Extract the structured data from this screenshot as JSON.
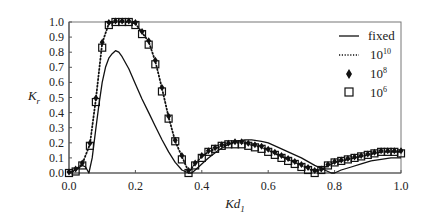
{
  "chart_data": {
    "type": "line",
    "title": "",
    "xlabel": "Kd",
    "xlabel_subscript": "1",
    "ylabel": "K",
    "ylabel_subscript": "r",
    "xlim": [
      0.0,
      1.0
    ],
    "ylim": [
      0.0,
      1.0
    ],
    "xticks": [
      "0.0",
      "0.2",
      "0.4",
      "0.6",
      "0.8",
      "1.0"
    ],
    "yticks": [
      "0.0",
      "0.1",
      "0.2",
      "0.3",
      "0.4",
      "0.5",
      "0.6",
      "0.7",
      "0.8",
      "0.9",
      "1.0"
    ],
    "grid": false,
    "legend_position": "upper right",
    "series": [
      {
        "name": "fixed",
        "style": "solid-line",
        "x": [
          0.0,
          0.02,
          0.04,
          0.05,
          0.06,
          0.07,
          0.08,
          0.09,
          0.1,
          0.11,
          0.12,
          0.13,
          0.14,
          0.15,
          0.16,
          0.18,
          0.2,
          0.22,
          0.24,
          0.26,
          0.28,
          0.3,
          0.32,
          0.34,
          0.36,
          0.37,
          0.38,
          0.4,
          0.42,
          0.45,
          0.48,
          0.5,
          0.53,
          0.55,
          0.58,
          0.6,
          0.63,
          0.66,
          0.7,
          0.74,
          0.77,
          0.79,
          0.8,
          0.82,
          0.85,
          0.88,
          0.91,
          0.94,
          0.97,
          1.0
        ],
        "y": [
          0.0,
          0.02,
          0.05,
          0.04,
          0.0,
          0.1,
          0.28,
          0.45,
          0.6,
          0.7,
          0.76,
          0.79,
          0.81,
          0.8,
          0.77,
          0.69,
          0.59,
          0.49,
          0.4,
          0.31,
          0.22,
          0.14,
          0.07,
          0.02,
          0.0,
          0.0,
          0.02,
          0.06,
          0.1,
          0.15,
          0.19,
          0.21,
          0.22,
          0.22,
          0.21,
          0.2,
          0.17,
          0.14,
          0.1,
          0.05,
          0.02,
          0.0,
          0.0,
          0.02,
          0.04,
          0.06,
          0.08,
          0.09,
          0.1,
          0.1
        ]
      },
      {
        "name": "10^10",
        "style": "dotted-line",
        "x": [
          0.0,
          0.02,
          0.04,
          0.063,
          0.081,
          0.1,
          0.12,
          0.14,
          0.16,
          0.18,
          0.2,
          0.22,
          0.24,
          0.26,
          0.28,
          0.3,
          0.32,
          0.34,
          0.36,
          0.38,
          0.4,
          0.42,
          0.44,
          0.46,
          0.48,
          0.5,
          0.52,
          0.54,
          0.56,
          0.58,
          0.6,
          0.62,
          0.64,
          0.66,
          0.68,
          0.7,
          0.72,
          0.74,
          0.76,
          0.78,
          0.8,
          0.82,
          0.84,
          0.86,
          0.88,
          0.9,
          0.92,
          0.94,
          0.96,
          0.98,
          1.0
        ],
        "y": [
          0.0,
          0.02,
          0.06,
          0.19,
          0.49,
          0.86,
          0.99,
          1.0,
          1.0,
          1.0,
          0.99,
          0.93,
          0.87,
          0.74,
          0.56,
          0.37,
          0.21,
          0.11,
          0.01,
          0.06,
          0.11,
          0.14,
          0.16,
          0.18,
          0.19,
          0.2,
          0.2,
          0.19,
          0.18,
          0.17,
          0.15,
          0.13,
          0.11,
          0.09,
          0.07,
          0.05,
          0.03,
          0.01,
          0.02,
          0.05,
          0.07,
          0.08,
          0.09,
          0.1,
          0.11,
          0.12,
          0.13,
          0.14,
          0.14,
          0.14,
          0.14
        ]
      },
      {
        "name": "10^8",
        "style": "diamond-marker",
        "x": [
          0.0,
          0.02,
          0.04,
          0.063,
          0.081,
          0.1,
          0.12,
          0.14,
          0.16,
          0.18,
          0.2,
          0.22,
          0.24,
          0.26,
          0.28,
          0.3,
          0.32,
          0.34,
          0.36,
          0.38,
          0.4,
          0.42,
          0.44,
          0.46,
          0.48,
          0.5,
          0.52,
          0.54,
          0.56,
          0.58,
          0.6,
          0.62,
          0.64,
          0.66,
          0.68,
          0.7,
          0.72,
          0.74,
          0.76,
          0.78,
          0.8,
          0.82,
          0.84,
          0.86,
          0.88,
          0.9,
          0.92,
          0.94,
          0.96,
          0.98,
          1.0
        ],
        "y": [
          0.0,
          0.02,
          0.06,
          0.19,
          0.49,
          0.86,
          0.99,
          1.0,
          1.0,
          1.0,
          0.99,
          0.93,
          0.87,
          0.74,
          0.56,
          0.37,
          0.21,
          0.11,
          0.01,
          0.06,
          0.11,
          0.14,
          0.16,
          0.18,
          0.19,
          0.2,
          0.2,
          0.19,
          0.18,
          0.17,
          0.15,
          0.13,
          0.11,
          0.09,
          0.07,
          0.05,
          0.03,
          0.01,
          0.02,
          0.05,
          0.07,
          0.08,
          0.09,
          0.1,
          0.11,
          0.12,
          0.13,
          0.14,
          0.14,
          0.14,
          0.14
        ]
      },
      {
        "name": "10^6",
        "style": "square-marker",
        "x": [
          0.0,
          0.02,
          0.04,
          0.063,
          0.081,
          0.1,
          0.12,
          0.14,
          0.16,
          0.18,
          0.2,
          0.22,
          0.24,
          0.26,
          0.28,
          0.3,
          0.32,
          0.34,
          0.36,
          0.38,
          0.4,
          0.42,
          0.44,
          0.46,
          0.48,
          0.5,
          0.52,
          0.54,
          0.56,
          0.58,
          0.6,
          0.62,
          0.64,
          0.66,
          0.68,
          0.7,
          0.72,
          0.74,
          0.76,
          0.78,
          0.8,
          0.82,
          0.84,
          0.86,
          0.88,
          0.9,
          0.92,
          0.94,
          0.96,
          0.98,
          1.0
        ],
        "y": [
          0.0,
          0.01,
          0.05,
          0.18,
          0.47,
          0.83,
          0.98,
          1.0,
          1.0,
          1.0,
          0.98,
          0.92,
          0.85,
          0.72,
          0.54,
          0.36,
          0.21,
          0.09,
          0.0,
          0.05,
          0.1,
          0.14,
          0.16,
          0.18,
          0.19,
          0.19,
          0.19,
          0.18,
          0.17,
          0.16,
          0.14,
          0.12,
          0.1,
          0.08,
          0.06,
          0.04,
          0.02,
          0.0,
          0.02,
          0.05,
          0.07,
          0.08,
          0.09,
          0.1,
          0.11,
          0.12,
          0.13,
          0.14,
          0.14,
          0.14,
          0.13
        ]
      }
    ]
  },
  "legend": {
    "items": [
      {
        "label": "fixed",
        "sup": ""
      },
      {
        "label": "10",
        "sup": "10"
      },
      {
        "label": "10",
        "sup": "8"
      },
      {
        "label": "10",
        "sup": "6"
      }
    ]
  },
  "axes": {
    "x_title": "Kd",
    "x_title_sub": "1",
    "y_title": "K",
    "y_title_sub": "r"
  }
}
